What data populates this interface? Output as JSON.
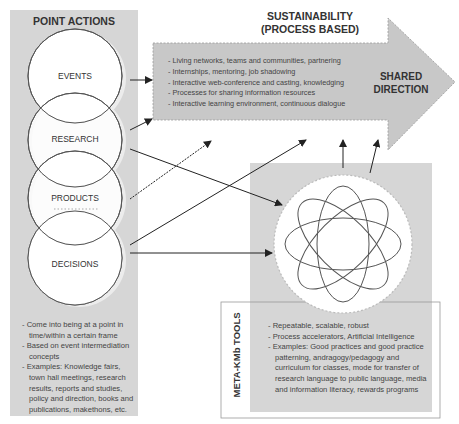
{
  "colors": {
    "panel_fill": "#d6d6d6",
    "arrow_fill": "#c8c8c8",
    "stroke": "#555555",
    "text": "#333333"
  },
  "point_actions": {
    "title": "POINT ACTIONS",
    "circles": [
      {
        "label": "EVENTS"
      },
      {
        "label": "RESEARCH"
      },
      {
        "label": "PRODUCTS"
      },
      {
        "label": "DECISIONS"
      }
    ],
    "bullets": [
      "Come into being at a point in time/within a certain frame",
      "Based on event intermediation concepts",
      "Examples: Knowledge fairs, town hall meetings, research results, reports and studies, policy and direction, books and publications, makethons, etc."
    ]
  },
  "sustainability": {
    "title_line1": "SUSTAINABILITY",
    "title_line2": "(PROCESS BASED)",
    "bullets": [
      "Living networks, teams and communities, partnering",
      "Internships, mentoring, job shadowing",
      "Interactive web-conference and casting, knowledging",
      "Processes for sharing information resources",
      "Interactive learning environment, continuous dialogue"
    ],
    "arrow_label_line1": "SHARED",
    "arrow_label_line2": "DIRECTION"
  },
  "meta_tools": {
    "title": "META-KMb TOOLS",
    "icon": "atom-orbits-icon",
    "bullets": [
      "Repeatable, scalable, robust",
      "Process accelerators, Artificial Intelligence",
      "Examples: Good practices and good practice patterning, andragogy/pedagogy and curriculum for classes, mode for transfer of research language to public language, media and information literacy, rewards programs"
    ]
  }
}
